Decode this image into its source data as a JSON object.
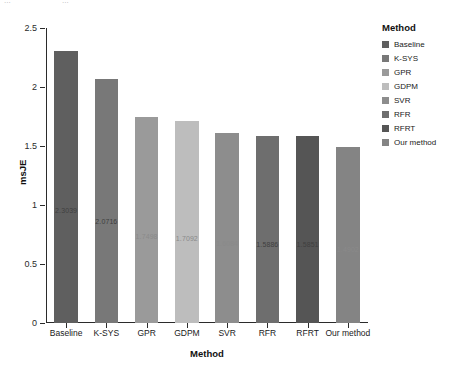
{
  "caption": {
    "line_left": "...",
    "line_right": "..."
  },
  "legend": {
    "title": "Method",
    "position": "right"
  },
  "chart_data": {
    "type": "bar",
    "title": "",
    "xlabel": "Method",
    "ylabel": "msJE",
    "categories": [
      "Baseline",
      "K-SYS",
      "GPR",
      "GDPM",
      "SVR",
      "RFR",
      "RFRT",
      "Our method"
    ],
    "values": [
      2.3039,
      2.0716,
      1.7498,
      1.7092,
      1.6084,
      1.5886,
      1.5851,
      1.4902
    ],
    "data_labels": [
      "2.3039",
      "2.0716",
      "1.7498",
      "1.7092",
      "1.6084",
      "1.5886",
      "1.5851",
      "1.4902"
    ],
    "colors": [
      "#5f5f5f",
      "#787878",
      "#9a9a9a",
      "#bdbdbd",
      "#8d8d8d",
      "#6e6e6e",
      "#555555",
      "#848484"
    ],
    "ylim": [
      0,
      2.5
    ],
    "yticks": [
      0,
      0.5,
      1,
      1.5,
      2,
      2.5
    ],
    "ytick_labels": [
      "0",
      "0.5",
      "1",
      "1.5",
      "2",
      "2.5"
    ],
    "grid": false,
    "legend_entries": [
      {
        "label": "Baseline",
        "color": "#5f5f5f"
      },
      {
        "label": "K-SYS",
        "color": "#787878"
      },
      {
        "label": "GPR",
        "color": "#9a9a9a"
      },
      {
        "label": "GDPM",
        "color": "#bdbdbd"
      },
      {
        "label": "SVR",
        "color": "#8d8d8d"
      },
      {
        "label": "RFR",
        "color": "#6e6e6e"
      },
      {
        "label": "RFRT",
        "color": "#555555"
      },
      {
        "label": "Our method",
        "color": "#848484"
      }
    ]
  }
}
